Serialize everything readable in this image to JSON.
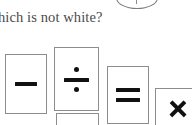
{
  "page": {
    "background_color": "#ffffff",
    "width": 192,
    "height": 125
  },
  "question": {
    "text": "hich is not white?",
    "full_text_guess": "hich is not white?",
    "color": "#4a4a4a"
  },
  "top_graphic": {
    "icon": "partial-circle-icon",
    "color": "#7c7c7c"
  },
  "cards": [
    {
      "id": "minus",
      "icon": "minus-icon",
      "symbol": "−",
      "label": "minus",
      "border_color": "#8d8d8d",
      "fill_color": "#ffffff",
      "glyph_color": "#111111"
    },
    {
      "id": "divide",
      "icon": "divide-icon",
      "symbol": "÷",
      "label": "divide",
      "border_color": "#8d8d8d",
      "fill_color": "#ffffff",
      "glyph_color": "#111111"
    },
    {
      "id": "partial",
      "icon": "blank-card-icon",
      "symbol": "",
      "label": "",
      "border_color": "#8d8d8d",
      "fill_color": "#ffffff",
      "glyph_color": "#111111"
    },
    {
      "id": "equals",
      "icon": "equals-icon",
      "symbol": "=",
      "label": "equals",
      "border_color": "#8d8d8d",
      "fill_color": "#ffffff",
      "glyph_color": "#111111"
    },
    {
      "id": "times",
      "icon": "multiply-icon",
      "symbol": "✕",
      "label": "multiply",
      "border_color": "#8d8d8d",
      "fill_color": "#ffffff",
      "glyph_color": "#111111"
    }
  ]
}
